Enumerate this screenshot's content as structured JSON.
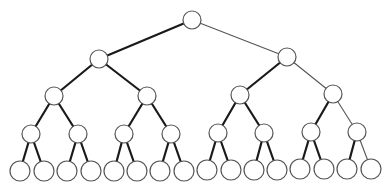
{
  "diagram": {
    "type": "complete-binary-tree",
    "depth": 4,
    "background": "#ffffff",
    "node_stroke": "#555555",
    "thick_edge_color": "#1a1a1a",
    "thin_edge_color": "#555555",
    "nodes": [
      {
        "id": "n0",
        "level": 0,
        "x": 192,
        "y": 20,
        "r": 9
      },
      {
        "id": "n1",
        "level": 1,
        "x": 99,
        "y": 59,
        "r": 9
      },
      {
        "id": "n2",
        "level": 1,
        "x": 287,
        "y": 57,
        "r": 9
      },
      {
        "id": "n3",
        "level": 2,
        "x": 54,
        "y": 96,
        "r": 9
      },
      {
        "id": "n4",
        "level": 2,
        "x": 147,
        "y": 96,
        "r": 9
      },
      {
        "id": "n5",
        "level": 2,
        "x": 240,
        "y": 95,
        "r": 9
      },
      {
        "id": "n6",
        "level": 2,
        "x": 333,
        "y": 94,
        "r": 9
      },
      {
        "id": "n7",
        "level": 3,
        "x": 31,
        "y": 134,
        "r": 9
      },
      {
        "id": "n8",
        "level": 3,
        "x": 78,
        "y": 134,
        "r": 9
      },
      {
        "id": "n9",
        "level": 3,
        "x": 124,
        "y": 134,
        "r": 9
      },
      {
        "id": "n10",
        "level": 3,
        "x": 171,
        "y": 134,
        "r": 9
      },
      {
        "id": "n11",
        "level": 3,
        "x": 218,
        "y": 133,
        "r": 9
      },
      {
        "id": "n12",
        "level": 3,
        "x": 264,
        "y": 133,
        "r": 9
      },
      {
        "id": "n13",
        "level": 3,
        "x": 311,
        "y": 132,
        "r": 9
      },
      {
        "id": "n14",
        "level": 3,
        "x": 357,
        "y": 132,
        "r": 9
      },
      {
        "id": "n15",
        "level": 4,
        "x": 20,
        "y": 171,
        "r": 10
      },
      {
        "id": "n16",
        "level": 4,
        "x": 44,
        "y": 171,
        "r": 10
      },
      {
        "id": "n17",
        "level": 4,
        "x": 67,
        "y": 171,
        "r": 10
      },
      {
        "id": "n18",
        "level": 4,
        "x": 91,
        "y": 171,
        "r": 10
      },
      {
        "id": "n19",
        "level": 4,
        "x": 114,
        "y": 171,
        "r": 10
      },
      {
        "id": "n20",
        "level": 4,
        "x": 137,
        "y": 171,
        "r": 10
      },
      {
        "id": "n21",
        "level": 4,
        "x": 160,
        "y": 171,
        "r": 10
      },
      {
        "id": "n22",
        "level": 4,
        "x": 184,
        "y": 171,
        "r": 10
      },
      {
        "id": "n23",
        "level": 4,
        "x": 207,
        "y": 170,
        "r": 10
      },
      {
        "id": "n24",
        "level": 4,
        "x": 231,
        "y": 170,
        "r": 10
      },
      {
        "id": "n25",
        "level": 4,
        "x": 254,
        "y": 170,
        "r": 10
      },
      {
        "id": "n26",
        "level": 4,
        "x": 277,
        "y": 170,
        "r": 10
      },
      {
        "id": "n27",
        "level": 4,
        "x": 300,
        "y": 169,
        "r": 10
      },
      {
        "id": "n28",
        "level": 4,
        "x": 324,
        "y": 169,
        "r": 10
      },
      {
        "id": "n29",
        "level": 4,
        "x": 347,
        "y": 169,
        "r": 10
      },
      {
        "id": "n30",
        "level": 4,
        "x": 371,
        "y": 169,
        "r": 10
      }
    ],
    "edges": [
      {
        "from": "n0",
        "to": "n1",
        "style": "thick"
      },
      {
        "from": "n0",
        "to": "n2",
        "style": "thin"
      },
      {
        "from": "n1",
        "to": "n3",
        "style": "thick"
      },
      {
        "from": "n1",
        "to": "n4",
        "style": "thick"
      },
      {
        "from": "n2",
        "to": "n5",
        "style": "thick"
      },
      {
        "from": "n2",
        "to": "n6",
        "style": "thin"
      },
      {
        "from": "n3",
        "to": "n7",
        "style": "thick"
      },
      {
        "from": "n3",
        "to": "n8",
        "style": "thick"
      },
      {
        "from": "n4",
        "to": "n9",
        "style": "thick"
      },
      {
        "from": "n4",
        "to": "n10",
        "style": "thick"
      },
      {
        "from": "n5",
        "to": "n11",
        "style": "thick"
      },
      {
        "from": "n5",
        "to": "n12",
        "style": "thick"
      },
      {
        "from": "n6",
        "to": "n13",
        "style": "thick"
      },
      {
        "from": "n6",
        "to": "n14",
        "style": "thin"
      },
      {
        "from": "n7",
        "to": "n15",
        "style": "thick"
      },
      {
        "from": "n7",
        "to": "n16",
        "style": "thick"
      },
      {
        "from": "n8",
        "to": "n17",
        "style": "thick"
      },
      {
        "from": "n8",
        "to": "n18",
        "style": "thick"
      },
      {
        "from": "n9",
        "to": "n19",
        "style": "thick"
      },
      {
        "from": "n9",
        "to": "n20",
        "style": "thick"
      },
      {
        "from": "n10",
        "to": "n21",
        "style": "thick"
      },
      {
        "from": "n10",
        "to": "n22",
        "style": "thick"
      },
      {
        "from": "n11",
        "to": "n23",
        "style": "thick"
      },
      {
        "from": "n11",
        "to": "n24",
        "style": "thick"
      },
      {
        "from": "n12",
        "to": "n25",
        "style": "thick"
      },
      {
        "from": "n12",
        "to": "n26",
        "style": "thick"
      },
      {
        "from": "n13",
        "to": "n27",
        "style": "thick"
      },
      {
        "from": "n13",
        "to": "n28",
        "style": "thick"
      },
      {
        "from": "n14",
        "to": "n29",
        "style": "thick"
      },
      {
        "from": "n14",
        "to": "n30",
        "style": "thin"
      }
    ]
  }
}
